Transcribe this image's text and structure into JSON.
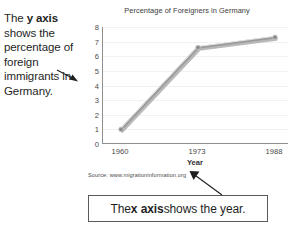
{
  "annotations": {
    "y_axis_note_prefix": "The ",
    "y_axis_note_bold": "y axis",
    "y_axis_note_suffix": " shows the percentage of foreign immigrants in Germany.",
    "x_axis_callout_prefix": "The ",
    "x_axis_callout_bold": "x axis",
    "x_axis_callout_suffix": " shows the year."
  },
  "source": "Source: www.migrationinformation.org",
  "chart_data": {
    "type": "line",
    "title": "Percentage of Foreigners in Germany",
    "xlabel": "Year",
    "ylabel": "",
    "categories": [
      "1960",
      "1973",
      "1988"
    ],
    "values": [
      1.0,
      6.6,
      7.3
    ],
    "series": [
      {
        "name": "Percentage of foreigners",
        "values": [
          1.0,
          6.6,
          7.3
        ]
      }
    ],
    "ylim": [
      0,
      8
    ],
    "yticks": [
      0,
      1,
      2,
      3,
      4,
      5,
      6,
      7,
      8
    ],
    "xticks": [
      "1960",
      "1973",
      "1988"
    ],
    "grid": true,
    "legend": "none",
    "line_color": "#9a9a9a",
    "marker_color": "#8c8c8c"
  }
}
